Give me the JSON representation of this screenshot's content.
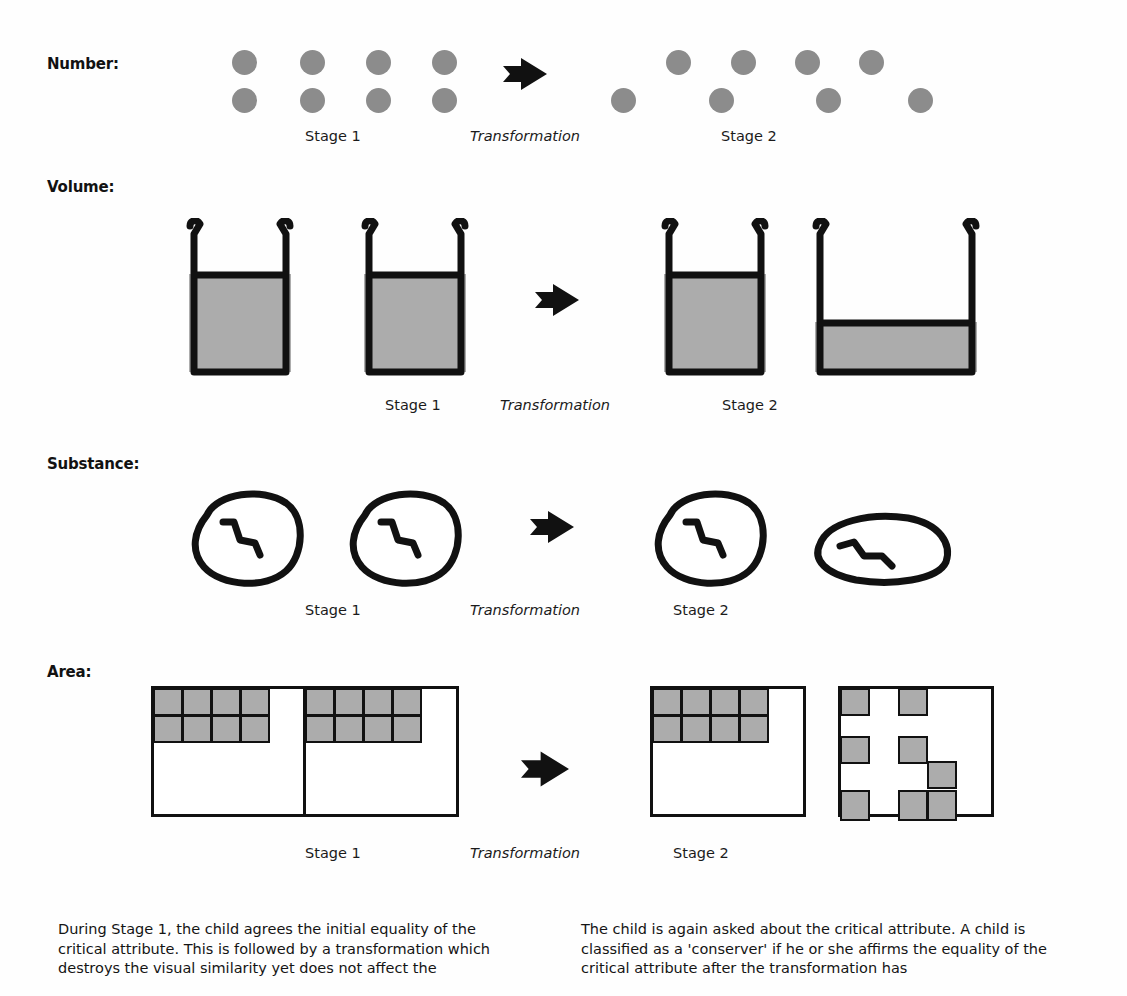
{
  "figure": {
    "rows": [
      {
        "label": "Number:",
        "stage1_caption": "Stage 1",
        "transformation_caption": "Transformation",
        "stage2_caption": "Stage 2",
        "stage1_description": "Two rows of four evenly spaced grey dots",
        "stage2_description": "Two staggered rows of four grey dots spread further apart",
        "dot_count_stage1": 8,
        "dot_count_stage2": 8
      },
      {
        "label": "Volume:",
        "stage1_caption": "Stage 1",
        "transformation_caption": "Transformation",
        "stage2_caption": "Stage 2",
        "stage1_description": "Two identical tall beakers filled to the same high level",
        "stage2_description": "One tall beaker filled high and one wide beaker filled low",
        "beakers_stage1": 2,
        "beakers_stage2": 2
      },
      {
        "label": "Substance:",
        "stage1_caption": "Stage 1",
        "transformation_caption": "Transformation",
        "stage2_caption": "Stage 2",
        "stage1_description": "Two identical round clay balls each with a squiggle mark",
        "stage2_description": "One round clay ball and one flattened clay ball",
        "blobs_stage1": 2,
        "blobs_stage2": 2
      },
      {
        "label": "Area:",
        "stage1_caption": "Stage 1",
        "transformation_caption": "Transformation",
        "stage2_caption": "Stage 2",
        "stage1_description": "Two identical fields each with eight blocks packed in the top-left corner",
        "stage2_description": "One field with eight packed blocks and one field with eight scattered blocks",
        "blocks_per_field": 8
      }
    ],
    "colors": {
      "dot_fill": "#8c8c8c",
      "liquid_fill": "#acacac",
      "block_fill": "#acacac",
      "outline": "#111111",
      "arrow": "#111111",
      "page_background": "#ffffff"
    }
  },
  "captions": {
    "left_column": "During Stage 1, the child agrees the initial equality of the critical attribute. This is followed by a transformation which destroys the visual similarity yet does not affect the",
    "right_column": "The child is again asked about the critical attribute. A child is classified as a 'conserver' if he or she affirms the equality of the critical attribute after the transformation has"
  }
}
